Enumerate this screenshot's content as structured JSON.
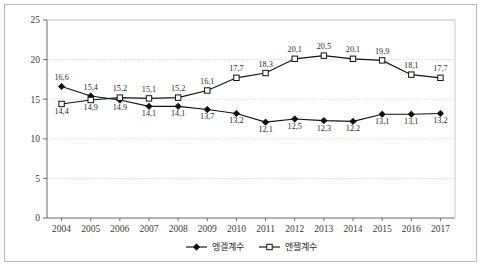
{
  "chart_data": {
    "type": "line",
    "title": "",
    "subtitle": "",
    "xlabel": "",
    "ylabel": "",
    "categories": [
      "2004",
      "2005",
      "2006",
      "2007",
      "2008",
      "2009",
      "2010",
      "2011",
      "2012",
      "2013",
      "2014",
      "2015",
      "2016",
      "2017"
    ],
    "ylim": [
      0,
      25
    ],
    "ytick_labels": [
      "0",
      "5",
      "10",
      "15",
      "20",
      "25"
    ],
    "ytick_values": [
      0,
      5,
      10,
      15,
      20,
      25
    ],
    "grid": true,
    "grid_style": "dotted-horizontal",
    "legend_position": "bottom-center",
    "decimal_separator": ",",
    "series": [
      {
        "name": "엥겔계수",
        "marker": "filled-diamond",
        "color": "#111111",
        "values": [
          16.6,
          15.4,
          14.9,
          14.1,
          14.1,
          13.7,
          13.2,
          12.1,
          12.5,
          12.3,
          12.2,
          13.1,
          13.1,
          13.2
        ],
        "labels": [
          "16,6",
          "15,4",
          "14,9",
          "14,1",
          "14,1",
          "13,7",
          "13,2",
          "12,1",
          "12,5",
          "12,3",
          "12,2",
          "13,1",
          "13,1",
          "13,2"
        ],
        "label_position": [
          "above",
          "above",
          "below",
          "below",
          "below",
          "below",
          "below",
          "below",
          "below",
          "below",
          "below",
          "below",
          "below",
          "below"
        ]
      },
      {
        "name": "엔젤계수",
        "marker": "open-square",
        "color": "#111111",
        "values": [
          14.4,
          14.9,
          15.2,
          15.1,
          15.2,
          16.1,
          17.7,
          18.3,
          20.1,
          20.5,
          20.1,
          19.9,
          18.1,
          17.7
        ],
        "labels": [
          "14,4",
          "14,9",
          "15,2",
          "15,1",
          "15,2",
          "16,1",
          "17,7",
          "18,3",
          "20,1",
          "20,5",
          "20,1",
          "19,9",
          "18,1",
          "17,7"
        ],
        "label_position": [
          "below",
          "below",
          "above",
          "above",
          "above",
          "above",
          "above",
          "above",
          "above",
          "above",
          "above",
          "above",
          "above",
          "above"
        ]
      }
    ]
  },
  "legend": {
    "items": [
      {
        "label": "엥겔계수",
        "marker": "filled-diamond"
      },
      {
        "label": "엔젤계수",
        "marker": "open-square"
      }
    ]
  }
}
